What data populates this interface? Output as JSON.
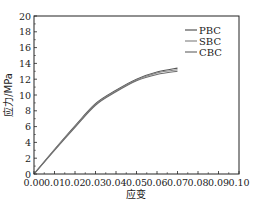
{
  "chart_data": {
    "type": "line",
    "title": "",
    "xlabel": "应变",
    "ylabel": "应力/MPa",
    "xlim": [
      0.0,
      0.1
    ],
    "ylim": [
      0,
      20
    ],
    "xticks": [
      "0.00",
      "0.01",
      "0.02",
      "0.03",
      "0.04",
      "0.05",
      "0.06",
      "0.07",
      "0.08",
      "0.09",
      "0.10"
    ],
    "yticks": [
      "0",
      "2",
      "4",
      "6",
      "8",
      "10",
      "12",
      "14",
      "16",
      "18",
      "20"
    ],
    "grid": false,
    "legend_position": "upper right",
    "x": [
      0.0,
      0.01,
      0.02,
      0.03,
      0.04,
      0.05,
      0.06,
      0.07
    ],
    "series": [
      {
        "name": "PBC",
        "color": "#555555",
        "values": [
          0.0,
          3.1,
          6.1,
          8.9,
          10.6,
          12.0,
          12.9,
          13.4
        ]
      },
      {
        "name": "SBC",
        "color": "#888888",
        "values": [
          0.0,
          3.1,
          6.0,
          8.8,
          10.5,
          11.9,
          12.8,
          13.2
        ]
      },
      {
        "name": "CBC",
        "color": "#6e6e6e",
        "values": [
          0.0,
          3.0,
          5.9,
          8.7,
          10.4,
          11.8,
          12.6,
          13.0
        ]
      }
    ]
  }
}
